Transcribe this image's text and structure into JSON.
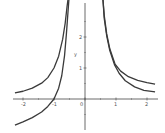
{
  "chart_data": {
    "type": "line",
    "title": "",
    "xlabel": "",
    "ylabel": "y",
    "xlim": [
      -2.3,
      2.3
    ],
    "ylim": [
      -1.1,
      3.2
    ],
    "grid": false,
    "legend": null,
    "x_ticks": [
      "-2",
      "-1",
      "0",
      "1",
      "2"
    ],
    "y_ticks": [
      "1",
      "2"
    ],
    "series": [
      {
        "name": "curve-1",
        "color": "#3a3a3a",
        "branches": [
          {
            "x": [
              -2.26,
              -2.0,
              -1.7,
              -1.4,
              -1.2,
              -1.0,
              -0.85,
              -0.72,
              -0.64,
              -0.58,
              -0.55
            ],
            "y": [
              0.2,
              0.25,
              0.35,
              0.51,
              0.69,
              1.0,
              1.38,
              1.93,
              2.44,
              2.97,
              3.2
            ]
          },
          {
            "x": [
              0.58,
              0.62,
              0.7,
              0.8,
              0.95,
              1.1,
              1.3,
              1.6,
              1.9,
              2.26
            ],
            "y": [
              3.2,
              2.6,
              2.04,
              1.56,
              1.11,
              0.83,
              0.59,
              0.39,
              0.28,
              0.23
            ]
          }
        ]
      },
      {
        "name": "curve-2",
        "color": "#3a3a3a",
        "branches": [
          {
            "x": [
              -2.26,
              -2.0,
              -1.7,
              -1.4,
              -1.2,
              -1.0,
              -0.85,
              -0.75,
              -0.66,
              -0.6,
              -0.52
            ],
            "y": [
              -0.84,
              -0.74,
              -0.6,
              -0.42,
              -0.24,
              0.0,
              0.35,
              0.75,
              1.4,
              2.1,
              3.2
            ]
          },
          {
            "x": [
              0.58,
              0.62,
              0.7,
              0.8,
              0.97,
              1.15,
              1.4,
              1.7,
              2.0,
              2.26
            ],
            "y": [
              3.2,
              2.7,
              2.1,
              1.62,
              1.12,
              0.9,
              0.72,
              0.6,
              0.53,
              0.48
            ]
          }
        ]
      }
    ]
  },
  "axes": {
    "origin_px": [
      85,
      99
    ],
    "unit_px": 31,
    "axis_color": "#444444",
    "ylabel": "y"
  }
}
